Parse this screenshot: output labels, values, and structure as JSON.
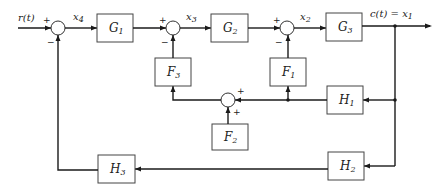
{
  "diagram": {
    "type": "block-diagram",
    "signals": {
      "input": "r(t)",
      "output": "c(t) = x",
      "output_sub": "1",
      "x4": "x",
      "x4_sub": "4",
      "x3": "x",
      "x3_sub": "3",
      "x2": "x",
      "x2_sub": "2"
    },
    "blocks": {
      "G1": {
        "name": "G",
        "sub": "1"
      },
      "G2": {
        "name": "G",
        "sub": "2"
      },
      "G3": {
        "name": "G",
        "sub": "3"
      },
      "F1": {
        "name": "F",
        "sub": "1"
      },
      "F2": {
        "name": "F",
        "sub": "2"
      },
      "F3": {
        "name": "F",
        "sub": "3"
      },
      "H1": {
        "name": "H",
        "sub": "1"
      },
      "H2": {
        "name": "H",
        "sub": "2"
      },
      "H3": {
        "name": "H",
        "sub": "3"
      }
    },
    "summing_junctions": {
      "s1": {
        "plus": "+",
        "minus": "−"
      },
      "s2": {
        "plus": "+",
        "minus": "−"
      },
      "s3": {
        "plus": "+",
        "minus": "−"
      },
      "s4": {
        "plus_right": "+",
        "plus_bottom": "+"
      }
    },
    "connections": [
      "r(t) -> s1(+)",
      "s1 -> G1 (x4)",
      "G1 -> s2(+)",
      "s2 -> G2 (x3)",
      "G2 -> s3(+)",
      "s3 -> G3 (x2)",
      "G3 -> c(t)=x1",
      "x1 -> H1 -> s4(+) & F1 -> s3(-)",
      "s4 -> F3 -> s2(-)",
      "F2 -> s4(+)",
      "x1 -> H2 -> H3 -> s1(-)"
    ]
  }
}
